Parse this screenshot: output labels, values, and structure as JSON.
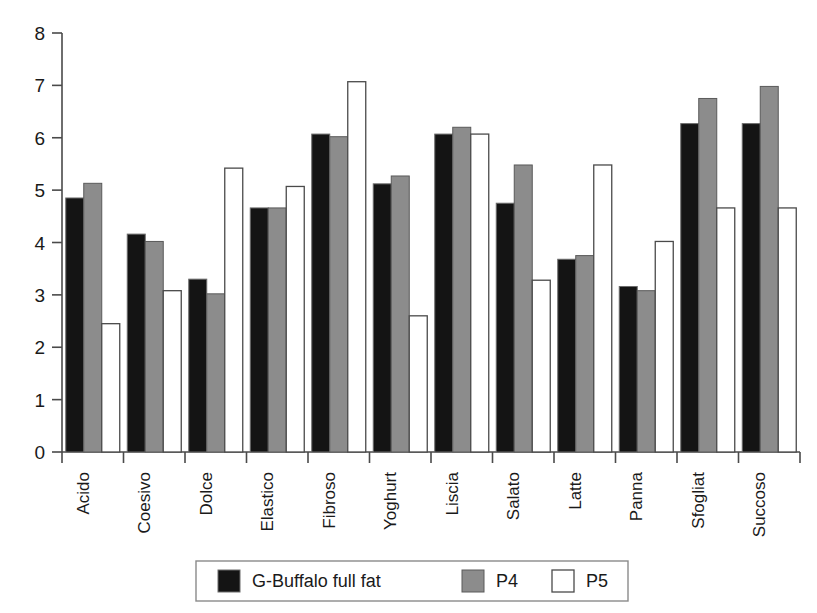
{
  "chart_data": {
    "type": "bar",
    "title": "",
    "subtitle": "",
    "xlabel": "",
    "ylabel": "",
    "ylim": [
      0,
      8
    ],
    "ytick_step": 1,
    "yticks": [
      "0",
      "1",
      "2",
      "3",
      "4",
      "5",
      "6",
      "7",
      "8"
    ],
    "grid": false,
    "legend_position": "bottom",
    "orientation": "vertical",
    "grouping": "clustered",
    "category_label_rotation": -90,
    "categories": [
      "Acido",
      "Coesivo",
      "Dolce",
      "Elastico",
      "Fibroso",
      "Yoghurt",
      "Liscia",
      "Salato",
      "Latte",
      "Panna",
      "Sfogliat",
      "Succoso"
    ],
    "series": [
      {
        "name": "G-Buffalo full fat",
        "color": "#141414",
        "fill": "solid-black",
        "values": [
          4.85,
          4.16,
          3.3,
          4.66,
          6.07,
          5.12,
          6.07,
          4.75,
          3.68,
          3.16,
          6.27,
          6.27
        ]
      },
      {
        "name": "P4",
        "color": "#8c8c8c",
        "fill": "gray",
        "values": [
          5.13,
          4.02,
          3.02,
          4.66,
          6.02,
          5.27,
          6.2,
          5.48,
          3.75,
          3.08,
          6.75,
          6.98
        ]
      },
      {
        "name": "P5",
        "color": "#ffffff",
        "fill": "white-outline",
        "values": [
          2.45,
          3.08,
          5.42,
          5.07,
          7.07,
          2.6,
          6.07,
          3.28,
          5.48,
          4.02,
          4.66,
          4.66
        ]
      }
    ]
  },
  "legend": {
    "items": [
      {
        "label": "G-Buffalo full fat",
        "swatch": "black-swatch"
      },
      {
        "label": "P4",
        "swatch": "gray-swatch"
      },
      {
        "label": "P5",
        "swatch": "white-swatch"
      }
    ]
  }
}
